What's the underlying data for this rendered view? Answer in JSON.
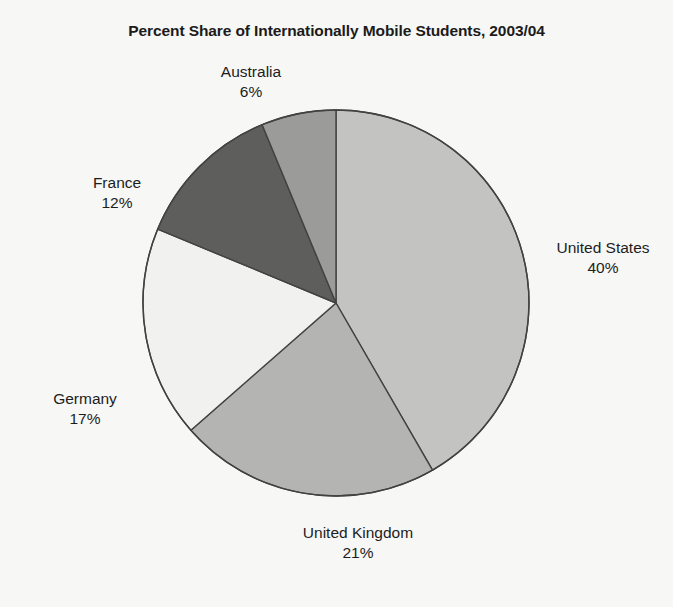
{
  "chart_data": {
    "type": "pie",
    "title": "Percent Share of Internationally Mobile Students, 2003/04",
    "xlabel": "",
    "ylabel": "",
    "unit": "percent",
    "legend": "none",
    "labels_position": "outside",
    "start_angle_deg": 0,
    "direction": "clockwise",
    "categories": [
      "United States",
      "United Kingdom",
      "Germany",
      "France",
      "Australia"
    ],
    "values": [
      40,
      21,
      17,
      12,
      6
    ],
    "value_labels": [
      "40%",
      "21%",
      "17%",
      "12%",
      "6%"
    ],
    "slice_colors": [
      "#c3c3c1",
      "#b4b4b2",
      "#f1f1ef",
      "#5e5e5c",
      "#9b9b99"
    ],
    "stroke_color": "#43423f",
    "background_color": "#f7f7f6",
    "text_color": "#1d1d1d",
    "slices": [
      {
        "name": "United States",
        "value": 40,
        "value_label": "40%",
        "color": "#c3c3c1"
      },
      {
        "name": "United Kingdom",
        "value": 21,
        "value_label": "21%",
        "color": "#b4b4b2"
      },
      {
        "name": "Germany",
        "value": 17,
        "value_label": "17%",
        "color": "#f1f1ef"
      },
      {
        "name": "France",
        "value": 12,
        "value_label": "12%",
        "color": "#5e5e5c"
      },
      {
        "name": "Australia",
        "value": 6,
        "value_label": "6%",
        "color": "#9b9b99"
      }
    ]
  },
  "geometry": {
    "center_x": 336,
    "center_y": 303,
    "radius": 193
  }
}
